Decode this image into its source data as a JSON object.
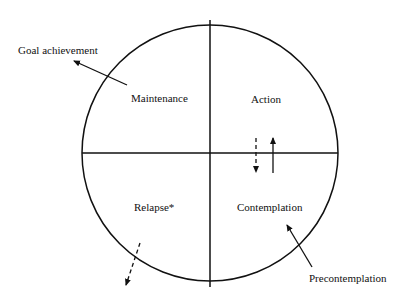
{
  "diagram": {
    "stages": {
      "maintenance": "Maintenance",
      "action": "Action",
      "relapse": "Relapse*",
      "contemplation": "Contemplation"
    },
    "external": {
      "goal": "Goal achievement",
      "precontemplation": "Precontemplation"
    },
    "colors": {
      "ink": "#111111",
      "background": "#ffffff"
    }
  }
}
